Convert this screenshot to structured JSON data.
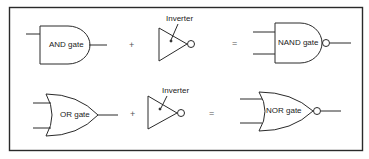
{
  "diagram": {
    "rows": [
      {
        "gate": "AND gate",
        "plus": "+",
        "inverter_label": "Inverter",
        "equals": "=",
        "result": "NAND gate"
      },
      {
        "gate": "OR gate",
        "plus": "+",
        "inverter_label": "Inverter",
        "equals": "=",
        "result": "NOR gate"
      }
    ],
    "colors": {
      "stroke": "#2a2a2a",
      "background": "#ffffff"
    }
  }
}
